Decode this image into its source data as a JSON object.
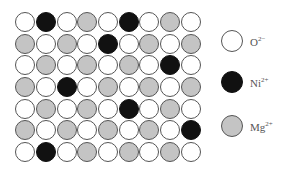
{
  "diagram": {
    "type": "ionic_lattice",
    "rows": 7,
    "cols": 9,
    "grid": [
      [
        "O",
        "N",
        "O",
        "M",
        "O",
        "N",
        "O",
        "M",
        "O"
      ],
      [
        "M",
        "O",
        "M",
        "O",
        "N",
        "O",
        "M",
        "O",
        "M"
      ],
      [
        "O",
        "M",
        "O",
        "M",
        "O",
        "M",
        "O",
        "N",
        "O"
      ],
      [
        "M",
        "O",
        "N",
        "O",
        "M",
        "O",
        "M",
        "O",
        "M"
      ],
      [
        "O",
        "M",
        "O",
        "M",
        "O",
        "N",
        "O",
        "M",
        "O"
      ],
      [
        "M",
        "O",
        "M",
        "O",
        "M",
        "O",
        "M",
        "O",
        "N"
      ],
      [
        "O",
        "N",
        "O",
        "M",
        "O",
        "M",
        "O",
        "M",
        "O"
      ]
    ]
  },
  "legend": {
    "items": [
      {
        "key": "O",
        "symbol": "O",
        "charge": "2−",
        "fill": "#ffffff"
      },
      {
        "key": "N",
        "symbol": "Ni",
        "charge": "2+",
        "fill": "#111111"
      },
      {
        "key": "M",
        "symbol": "Mg",
        "charge": "2+",
        "fill": "#c4c4c4"
      }
    ]
  }
}
